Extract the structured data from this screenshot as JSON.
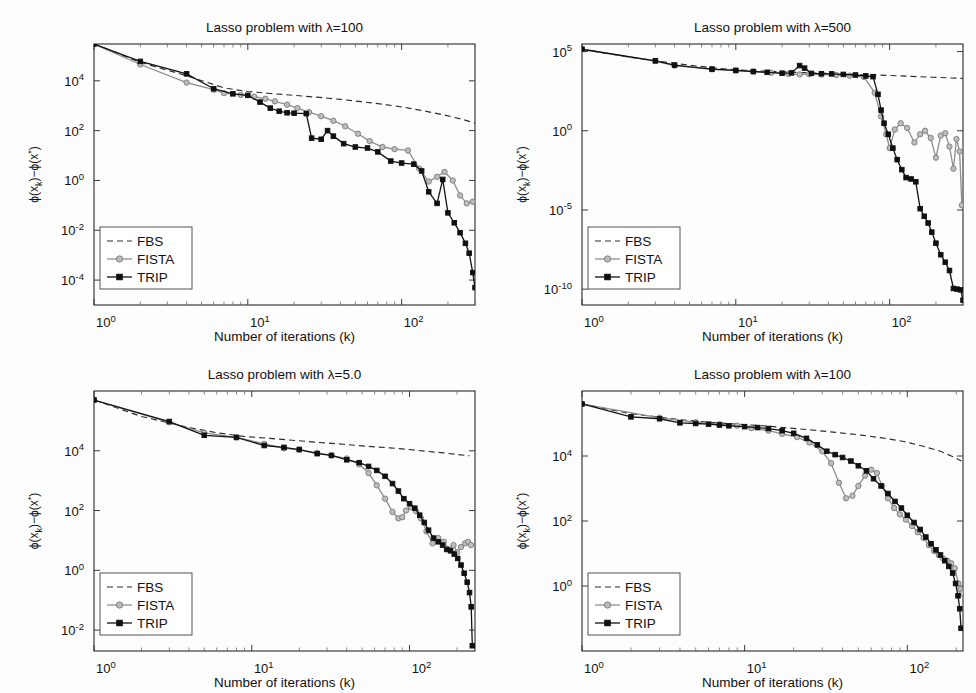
{
  "figure": {
    "background": "#fdfdfd",
    "width": 976,
    "height": 693,
    "panel_count": 4
  },
  "common": {
    "xlabel": "Number of iterations (k)",
    "ylabel": "ϕ(x_k)−ϕ(x*)",
    "legend_entries": [
      "FBS",
      "FISTA",
      "TRIP"
    ],
    "colors": {
      "fbs": "#2b2b2b",
      "fista": "#8d8d8d",
      "trip": "#121212",
      "axis": "#2a2a2a",
      "text": "#111111"
    }
  },
  "chart_data": [
    {
      "id": "panel-lambda-100-top-left",
      "type": "line",
      "title": "Lasso problem with λ=100",
      "xlabel": "Number of iterations (k)",
      "ylabel": "ϕ(x_k)−ϕ(x*)",
      "xscale": "log",
      "yscale": "log",
      "xlim": [
        1,
        300
      ],
      "ylim": [
        1e-05,
        300000.0
      ],
      "xticks": [
        1,
        10,
        100
      ],
      "xticklabels": [
        "10^0",
        "10^1",
        "10^2"
      ],
      "yticks": [
        0.0001,
        0.01,
        1,
        100,
        10000
      ],
      "yticklabels": [
        "10^-4",
        "10^-2",
        "10^0",
        "10^2",
        "10^4"
      ],
      "grid": false,
      "legend_position": "lower left",
      "series": [
        {
          "name": "FBS",
          "style": "dashed",
          "marker": "none",
          "color": "#2b2b2b",
          "x": [
            1,
            2,
            4,
            7,
            10,
            14,
            20,
            28,
            40,
            55,
            75,
            100,
            140,
            190,
            250,
            300
          ],
          "y": [
            300000,
            55000,
            16000,
            5200,
            3700,
            3100,
            2600,
            2200,
            1800,
            1450,
            1150,
            900,
            620,
            420,
            280,
            200
          ]
        },
        {
          "name": "FISTA",
          "style": "solid",
          "marker": "circle",
          "color": "#8d8d8d",
          "x": [
            1,
            2,
            4,
            6,
            7,
            9,
            11,
            13,
            15,
            18,
            21,
            25,
            30,
            36,
            43,
            52,
            62,
            75,
            90,
            110,
            130,
            150,
            170,
            190,
            215,
            240,
            265,
            290
          ],
          "y": [
            300000,
            45000,
            8500,
            4400,
            3200,
            2700,
            2300,
            1900,
            1500,
            1100,
            800,
            550,
            380,
            250,
            150,
            75,
            38,
            22,
            18,
            16,
            3.0,
            0.9,
            1.4,
            2.2,
            1.0,
            0.25,
            0.12,
            0.14
          ]
        },
        {
          "name": "TRIP",
          "style": "solid",
          "marker": "square",
          "color": "#121212",
          "x": [
            1,
            2,
            4,
            6,
            8,
            10,
            12,
            14,
            16,
            18,
            20,
            24,
            26,
            30,
            33,
            36,
            42,
            50,
            60,
            70,
            85,
            100,
            120,
            135,
            150,
            170,
            185,
            200,
            220,
            240,
            260,
            275,
            290,
            300
          ],
          "y": [
            300000,
            60000,
            19000,
            4800,
            3000,
            2600,
            1400,
            800,
            600,
            520,
            500,
            480,
            50,
            45,
            100,
            60,
            30,
            22,
            20,
            14,
            6,
            5,
            4.5,
            2.4,
            0.35,
            0.12,
            1.1,
            0.05,
            0.02,
            0.008,
            0.003,
            0.0012,
            0.0002,
            5e-05
          ]
        }
      ]
    },
    {
      "id": "panel-lambda-500-top-right",
      "type": "line",
      "title": "Lasso problem with λ=500",
      "xlabel": "Number of iterations (k)",
      "ylabel": "ϕ(x_k)−ϕ(x*)",
      "xscale": "log",
      "yscale": "log",
      "xlim": [
        1,
        300
      ],
      "ylim": [
        1e-11,
        300000.0
      ],
      "xticks": [
        1,
        10,
        100
      ],
      "xticklabels": [
        "10^0",
        "10^1",
        "10^2"
      ],
      "yticks": [
        1e-10,
        1e-05,
        1,
        100000
      ],
      "yticklabels": [
        "10^-10",
        "10^-5",
        "10^0",
        "10^5"
      ],
      "grid": false,
      "legend_position": "lower left",
      "series": [
        {
          "name": "FBS",
          "style": "dashed",
          "marker": "none",
          "color": "#2b2b2b",
          "x": [
            1,
            2,
            4,
            7,
            10,
            14,
            20,
            28,
            40,
            55,
            75,
            100,
            140,
            190,
            250,
            300
          ],
          "y": [
            140000,
            45000,
            18000,
            9500,
            7000,
            6000,
            5200,
            4700,
            4200,
            3800,
            3400,
            3100,
            2700,
            2400,
            2150,
            2000
          ]
        },
        {
          "name": "FISTA",
          "style": "solid",
          "marker": "circle",
          "color": "#8d8d8d",
          "x": [
            1,
            3,
            4,
            7,
            10,
            13,
            17,
            22,
            26,
            30,
            36,
            45,
            55,
            68,
            80,
            88,
            95,
            100,
            108,
            118,
            130,
            145,
            158,
            170,
            185,
            200,
            215,
            230,
            245,
            260,
            272,
            285,
            295
          ],
          "y": [
            140000,
            25000,
            13000,
            7500,
            6200,
            5400,
            4600,
            3800,
            3600,
            3700,
            3500,
            3300,
            3000,
            2500,
            250,
            8,
            0.6,
            0.08,
            1.2,
            3.0,
            1.5,
            0.18,
            0.6,
            1.0,
            0.35,
            0.02,
            0.5,
            0.7,
            0.1,
            0.004,
            0.3,
            0.05,
            2e-05
          ]
        },
        {
          "name": "TRIP",
          "style": "solid",
          "marker": "square",
          "color": "#121212",
          "x": [
            1,
            3,
            4,
            7,
            10,
            13,
            16,
            20,
            23,
            26,
            28,
            31,
            36,
            42,
            50,
            60,
            70,
            78,
            84,
            88,
            92,
            98,
            105,
            112,
            120,
            128,
            138,
            148,
            158,
            168,
            178,
            188,
            200,
            215,
            230,
            245,
            260,
            275,
            290,
            300
          ],
          "y": [
            140000,
            26000,
            14000,
            7800,
            6500,
            5500,
            4900,
            4300,
            4500,
            13000,
            9000,
            4200,
            4000,
            3900,
            3600,
            3300,
            2900,
            2600,
            200,
            20,
            3,
            0.6,
            0.08,
            0.015,
            0.0035,
            0.0011,
            0.0009,
            0.0006,
            1.2e-05,
            4e-06,
            1.5e-06,
            4e-07,
            8e-08,
            1.5e-08,
            5e-09,
            1.5e-09,
            1.1e-10,
            1e-10,
            9e-11,
            2e-11
          ]
        }
      ]
    },
    {
      "id": "panel-lambda-5p0-bottom-left",
      "type": "line",
      "title": "Lasso problem with λ=5.0",
      "xlabel": "Number of iterations (k)",
      "ylabel": "ϕ(x_k)−ϕ(x*)",
      "xscale": "log",
      "yscale": "log",
      "xlim": [
        1,
        260
      ],
      "ylim": [
        0.002,
        1000000.0
      ],
      "xticks": [
        1,
        10,
        100
      ],
      "xticklabels": [
        "10^0",
        "10^1",
        "10^2"
      ],
      "yticks": [
        0.01,
        1,
        100,
        10000
      ],
      "yticklabels": [
        "10^-2",
        "10^0",
        "10^2",
        "10^4"
      ],
      "grid": false,
      "legend_position": "lower left",
      "series": [
        {
          "name": "FBS",
          "style": "dashed",
          "marker": "none",
          "color": "#2b2b2b",
          "x": [
            1,
            2,
            4,
            6,
            9,
            13,
            19,
            27,
            38,
            55,
            75,
            100,
            130,
            165,
            200,
            240
          ],
          "y": [
            500000,
            140000,
            60000,
            40000,
            30000,
            26000,
            22000,
            19000,
            16500,
            14000,
            12500,
            11000,
            9500,
            8500,
            7500,
            6800
          ]
        },
        {
          "name": "FISTA",
          "style": "solid",
          "marker": "circle",
          "color": "#8d8d8d",
          "x": [
            1,
            3,
            5,
            8,
            12,
            16,
            20,
            26,
            32,
            40,
            48,
            55,
            62,
            70,
            78,
            85,
            90,
            95,
            102,
            110,
            118,
            128,
            140,
            152,
            165,
            178,
            190,
            200,
            212,
            225,
            235,
            245
          ],
          "y": [
            500000,
            90000,
            40000,
            28000,
            17000,
            12000,
            11000,
            8500,
            7000,
            5500,
            3500,
            1800,
            700,
            250,
            90,
            55,
            60,
            100,
            130,
            95,
            55,
            20,
            8,
            12,
            9,
            5,
            7,
            4,
            6,
            8,
            9,
            7
          ]
        },
        {
          "name": "TRIP",
          "style": "solid",
          "marker": "square",
          "color": "#121212",
          "x": [
            1,
            3,
            5,
            8,
            12,
            16,
            20,
            26,
            32,
            40,
            48,
            55,
            62,
            70,
            78,
            85,
            92,
            100,
            108,
            116,
            124,
            132,
            142,
            152,
            162,
            172,
            182,
            192,
            202,
            212,
            222,
            232,
            240,
            246,
            250
          ],
          "y": [
            500000,
            95000,
            33000,
            28000,
            15000,
            13000,
            11000,
            8000,
            7000,
            5000,
            4000,
            3000,
            2200,
            1400,
            800,
            450,
            250,
            170,
            120,
            70,
            40,
            22,
            12,
            9,
            7,
            5,
            4.5,
            3.5,
            2.5,
            1.5,
            0.8,
            0.4,
            0.18,
            0.06,
            0.003
          ]
        }
      ]
    },
    {
      "id": "panel-lambda-100-bottom-right",
      "type": "line",
      "title": "Lasso problem with λ=100",
      "xlabel": "Number of iterations (k)",
      "ylabel": "ϕ(x_k)−ϕ(x*)",
      "xscale": "log",
      "yscale": "log",
      "xlim": [
        1,
        220
      ],
      "ylim": [
        0.01,
        1000000.0
      ],
      "xticks": [
        1,
        10,
        100
      ],
      "xticklabels": [
        "10^0",
        "10^1",
        "10^2"
      ],
      "yticks": [
        1,
        100,
        10000
      ],
      "yticklabels": [
        "10^0",
        "10^2",
        "10^4"
      ],
      "grid": false,
      "legend_position": "lower left",
      "series": [
        {
          "name": "FBS",
          "style": "dashed",
          "marker": "none",
          "color": "#2b2b2b",
          "x": [
            1,
            2,
            4,
            6,
            9,
            13,
            19,
            27,
            38,
            52,
            70,
            95,
            125,
            160,
            195,
            215
          ],
          "y": [
            400000,
            200000,
            130000,
            110000,
            95000,
            85000,
            72000,
            62000,
            52000,
            44000,
            36000,
            28000,
            20000,
            14000,
            9000,
            7000
          ]
        },
        {
          "name": "FISTA",
          "style": "solid",
          "marker": "circle",
          "color": "#8d8d8d",
          "x": [
            1,
            3,
            5,
            7,
            9,
            11,
            14,
            17,
            21,
            25,
            30,
            34,
            38,
            42,
            46,
            50,
            55,
            60,
            65,
            70,
            76,
            83,
            90,
            98,
            107,
            116,
            126,
            136,
            146,
            156,
            166,
            176,
            186,
            196,
            206,
            212,
            216
          ],
          "y": [
            400000,
            150000,
            110000,
            95000,
            85000,
            72000,
            60000,
            48000,
            38000,
            26000,
            14000,
            6000,
            1500,
            500,
            600,
            1200,
            2500,
            3800,
            3000,
            1200,
            500,
            250,
            160,
            110,
            70,
            45,
            30,
            18,
            12,
            9,
            7,
            6,
            5,
            3.5,
            1.2,
            0.8,
            0.6
          ]
        },
        {
          "name": "TRIP",
          "style": "solid",
          "marker": "square",
          "color": "#121212",
          "x": [
            1,
            2,
            3,
            4,
            5,
            6,
            7,
            8,
            10,
            12,
            14,
            17,
            20,
            24,
            28,
            32,
            36,
            40,
            45,
            50,
            56,
            62,
            69,
            76,
            84,
            92,
            100,
            110,
            120,
            130,
            140,
            150,
            160,
            170,
            180,
            190,
            198,
            205,
            210,
            214
          ],
          "y": [
            400000,
            160000,
            140000,
            105000,
            100000,
            95000,
            90000,
            85000,
            80000,
            75000,
            70000,
            60000,
            50000,
            35000,
            22000,
            14000,
            11000,
            9000,
            7000,
            5000,
            3500,
            2000,
            1200,
            700,
            400,
            250,
            150,
            90,
            55,
            32,
            20,
            13,
            9,
            6,
            4,
            2.5,
            1.2,
            0.5,
            0.2,
            0.05
          ]
        }
      ]
    }
  ],
  "panels_layout": [
    {
      "left": 0,
      "top": 0,
      "width": 488,
      "height": 347
    },
    {
      "left": 488,
      "top": 0,
      "width": 488,
      "height": 347
    },
    {
      "left": 0,
      "top": 347,
      "width": 488,
      "height": 346
    },
    {
      "left": 488,
      "top": 347,
      "width": 488,
      "height": 346
    }
  ]
}
